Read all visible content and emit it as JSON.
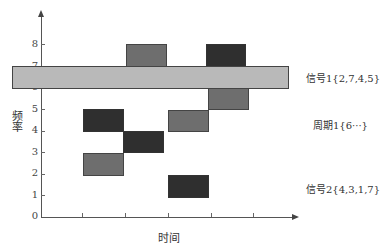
{
  "diagram": {
    "x_axis_label": "时间",
    "y_axis_label": "频率",
    "y_ticks": [
      "0",
      "1",
      "2",
      "3",
      "4",
      "5",
      "6",
      "7",
      "8"
    ],
    "x_tick_count": 5
  },
  "legend": {
    "signal1": "信号1{2,7,4,5}",
    "period1": "周期1{6···}",
    "signal2": "信号2{4,3,1,7}"
  },
  "colors": {
    "dark": "#2f2f2f",
    "mid": "#6e6e6e",
    "light": "#b9b9b9"
  },
  "blocks": [
    {
      "series": "signal1",
      "slot": 1,
      "freq": 2,
      "shade": "mid"
    },
    {
      "series": "signal1",
      "slot": 2,
      "freq": 7,
      "shade": "mid"
    },
    {
      "series": "signal1",
      "slot": 3,
      "freq": 4,
      "shade": "mid"
    },
    {
      "series": "signal1",
      "slot": 4,
      "freq": 5,
      "shade": "mid"
    },
    {
      "series": "signal2",
      "slot": 1,
      "freq": 4,
      "shade": "dark"
    },
    {
      "series": "signal2",
      "slot": 2,
      "freq": 3,
      "shade": "dark"
    },
    {
      "series": "signal2",
      "slot": 3,
      "freq": 1,
      "shade": "dark"
    },
    {
      "series": "signal2",
      "slot": 4,
      "freq": 7,
      "shade": "dark"
    },
    {
      "series": "period1",
      "slot": "all",
      "freq": 6,
      "shade": "light"
    }
  ]
}
